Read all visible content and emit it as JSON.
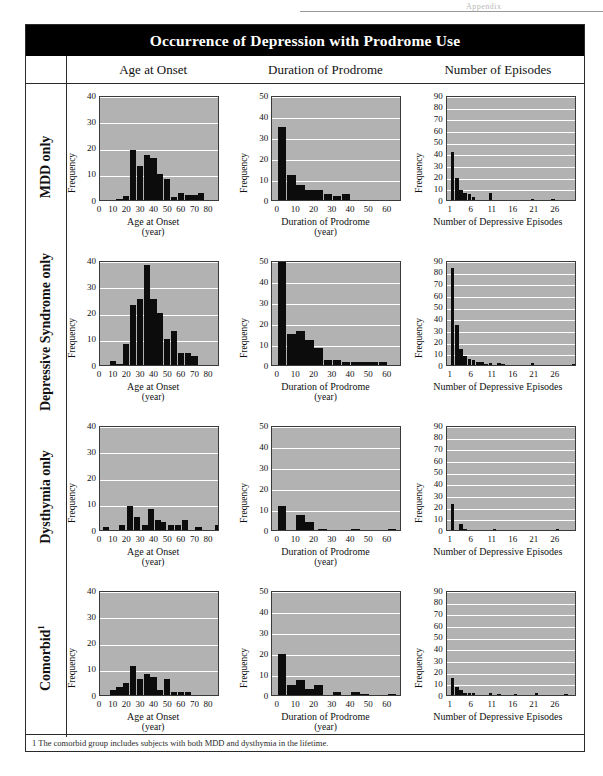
{
  "page": {
    "top_artifact": "Appendix",
    "title": "Occurrence of Depression with Prodrome Use",
    "footnote": "1  The comorbid group includes subjects with both MDD and dysthymia in the lifetime."
  },
  "columns": [
    {
      "label": "Age at Onset"
    },
    {
      "label": "Duration of Prodrome"
    },
    {
      "label": "Number of Episodes"
    }
  ],
  "rows": [
    {
      "label": "MDD only",
      "sup": ""
    },
    {
      "label": "Depressive Syndrome only",
      "sup": ""
    },
    {
      "label": "Dysthymia only",
      "sup": ""
    },
    {
      "label": "Comorbid",
      "sup": "1"
    }
  ],
  "axes": {
    "ylabel": "Frequency",
    "age": {
      "xlabel": "Age at Onset",
      "xunit": "(year)",
      "xticks": [
        0,
        10,
        20,
        30,
        40,
        50,
        60,
        70,
        80
      ],
      "xlim": [
        0,
        88
      ],
      "ylim": [
        0,
        40
      ],
      "yticks": [
        0,
        10,
        20,
        30,
        40
      ]
    },
    "duration": {
      "xlabel": "Duration of Prodrome",
      "xunit": "(year)",
      "xticks": [
        0,
        10,
        20,
        30,
        40,
        50,
        60
      ],
      "xlim": [
        -3,
        68
      ],
      "ylim": [
        0,
        50
      ],
      "yticks": [
        0,
        10,
        20,
        30,
        40,
        50
      ]
    },
    "episodes": {
      "xlabel": "Number of Depressive Episodes",
      "xunit": "",
      "xticks": [
        1,
        6,
        11,
        16,
        21,
        26
      ],
      "xlim": [
        0,
        31
      ],
      "ylim": [
        0,
        90
      ],
      "yticks": [
        0,
        10,
        20,
        30,
        40,
        50,
        60,
        70,
        80,
        90
      ]
    }
  },
  "chart_data": [
    {
      "type": "bar",
      "id": "mdd-age",
      "group": "MDD only",
      "title": "Age at Onset",
      "xlabel": "Age at Onset (year)",
      "ylabel": "Frequency",
      "xlim": [
        0,
        88
      ],
      "ylim": [
        0,
        40
      ],
      "grid": true,
      "x": [
        12,
        17,
        22,
        27,
        32,
        37,
        42,
        47,
        52,
        57,
        62,
        67,
        72
      ],
      "values": [
        0.5,
        1.5,
        19,
        13,
        17,
        16,
        10,
        8,
        1,
        2.5,
        2,
        2,
        2.5
      ]
    },
    {
      "type": "bar",
      "id": "mdd-duration",
      "group": "MDD only",
      "title": "Duration of Prodrome",
      "xlabel": "Duration of Prodrome (year)",
      "ylabel": "Frequency",
      "xlim": [
        -3,
        68
      ],
      "ylim": [
        0,
        50
      ],
      "grid": true,
      "x": [
        0,
        5,
        10,
        15,
        20,
        25,
        30,
        35
      ],
      "values": [
        35,
        12,
        7,
        5,
        5,
        3,
        2,
        3
      ]
    },
    {
      "type": "bar",
      "id": "mdd-episodes",
      "group": "MDD only",
      "title": "Number of Episodes",
      "xlabel": "Number of Depressive Episodes",
      "ylabel": "Frequency",
      "xlim": [
        0,
        31
      ],
      "ylim": [
        0,
        90
      ],
      "grid": true,
      "x": [
        1,
        2,
        3,
        4,
        5,
        6,
        10,
        20,
        25
      ],
      "values": [
        41,
        19,
        9,
        6,
        5,
        3,
        6,
        1,
        1
      ]
    },
    {
      "type": "bar",
      "id": "ds-age",
      "group": "Depressive Syndrome only",
      "title": "Age at Onset",
      "xlabel": "Age at Onset (year)",
      "ylabel": "Frequency",
      "xlim": [
        0,
        88
      ],
      "ylim": [
        0,
        40
      ],
      "grid": true,
      "x": [
        7,
        12,
        17,
        22,
        27,
        32,
        37,
        42,
        47,
        52,
        57,
        62,
        67
      ],
      "values": [
        1.5,
        0.5,
        8,
        23,
        25,
        38,
        25,
        20,
        10,
        13,
        4.5,
        4.5,
        3.5
      ]
    },
    {
      "type": "bar",
      "id": "ds-duration",
      "group": "Depressive Syndrome only",
      "title": "Duration of Prodrome",
      "xlabel": "Duration of Prodrome (year)",
      "ylabel": "Frequency",
      "xlim": [
        -3,
        68
      ],
      "ylim": [
        0,
        50
      ],
      "grid": true,
      "x": [
        0,
        5,
        10,
        15,
        20,
        25,
        30,
        35,
        40,
        45,
        50,
        55
      ],
      "values": [
        49,
        15,
        16,
        12,
        8,
        2.5,
        2.5,
        1.5,
        1.5,
        1.5,
        1.5,
        1.5
      ]
    },
    {
      "type": "bar",
      "id": "ds-episodes",
      "group": "Depressive Syndrome only",
      "title": "Number of Episodes",
      "xlabel": "Number of Depressive Episodes",
      "ylabel": "Frequency",
      "xlim": [
        0,
        31
      ],
      "ylim": [
        0,
        90
      ],
      "grid": true,
      "x": [
        1,
        2,
        3,
        4,
        5,
        6,
        7,
        8,
        9,
        10,
        12,
        13,
        20,
        30
      ],
      "values": [
        83,
        34,
        14,
        8,
        5,
        4,
        2.5,
        2.5,
        1,
        2,
        1.5,
        1,
        1.5,
        1
      ]
    },
    {
      "type": "bar",
      "id": "dys-age",
      "group": "Dysthymia only",
      "title": "Age at Onset",
      "xlabel": "Age at Onset (year)",
      "ylabel": "Frequency",
      "xlim": [
        0,
        88
      ],
      "ylim": [
        0,
        40
      ],
      "grid": true,
      "x": [
        2,
        14,
        20,
        25,
        31,
        35,
        40,
        44,
        50,
        55,
        60,
        70,
        84
      ],
      "values": [
        1,
        1.8,
        9,
        5,
        2,
        8,
        4,
        3,
        2,
        2,
        4,
        1.2,
        1.8
      ]
    },
    {
      "type": "bar",
      "id": "dys-duration",
      "group": "Dysthymia only",
      "title": "Duration of Prodrome",
      "xlabel": "Duration of Prodrome (year)",
      "ylabel": "Frequency",
      "xlim": [
        -3,
        68
      ],
      "ylim": [
        0,
        50
      ],
      "grid": true,
      "x": [
        0,
        10,
        15,
        22,
        40,
        60
      ],
      "values": [
        11.5,
        7,
        4,
        0.5,
        0.5,
        0.5
      ]
    },
    {
      "type": "bar",
      "id": "dys-episodes",
      "group": "Dysthymia only",
      "title": "Number of Episodes",
      "xlabel": "Number of Depressive Episodes",
      "ylabel": "Frequency",
      "xlim": [
        0,
        31
      ],
      "ylim": [
        0,
        90
      ],
      "grid": true,
      "x": [
        1,
        3,
        4,
        11,
        26
      ],
      "values": [
        22,
        5,
        1,
        0.6,
        0.6
      ]
    },
    {
      "type": "bar",
      "id": "com-age",
      "group": "Comorbid",
      "title": "Age at Onset",
      "xlabel": "Age at Onset (year)",
      "ylabel": "Frequency",
      "xlim": [
        0,
        88
      ],
      "ylim": [
        0,
        40
      ],
      "grid": true,
      "x": [
        7,
        12,
        17,
        22,
        27,
        32,
        37,
        42,
        47,
        52,
        57,
        62
      ],
      "values": [
        2,
        3,
        4.5,
        11,
        6,
        8,
        7,
        2,
        6,
        1,
        1,
        1
      ]
    },
    {
      "type": "bar",
      "id": "com-duration",
      "group": "Comorbid",
      "title": "Duration of Prodrome",
      "xlabel": "Duration of Prodrome (year)",
      "ylabel": "Frequency",
      "xlim": [
        -3,
        68
      ],
      "ylim": [
        0,
        50
      ],
      "grid": true,
      "x": [
        0,
        5,
        10,
        15,
        20,
        30,
        40,
        45,
        60
      ],
      "values": [
        19.5,
        5,
        7,
        3,
        5,
        1.5,
        1.5,
        0.5,
        0.5
      ]
    },
    {
      "type": "bar",
      "id": "com-episodes",
      "group": "Comorbid",
      "title": "Number of Episodes",
      "xlabel": "Number of Depressive Episodes",
      "ylabel": "Frequency",
      "xlim": [
        0,
        31
      ],
      "ylim": [
        0,
        90
      ],
      "grid": true,
      "x": [
        1,
        2,
        3,
        4,
        5,
        6,
        10,
        12,
        16,
        21,
        28
      ],
      "values": [
        15,
        7,
        4,
        2,
        1.5,
        1.5,
        1.5,
        1,
        1,
        1.5,
        0.5
      ]
    }
  ]
}
